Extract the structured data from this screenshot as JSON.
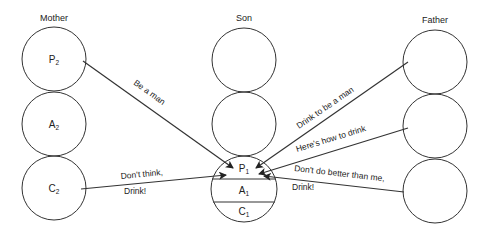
{
  "columns": {
    "mother": {
      "title": "Mother"
    },
    "son": {
      "title": "Son"
    },
    "father": {
      "title": "Father"
    }
  },
  "mother_states": [
    {
      "letter": "P",
      "sub": "2"
    },
    {
      "letter": "A",
      "sub": "2"
    },
    {
      "letter": "C",
      "sub": "2"
    }
  ],
  "son_states": [
    {
      "letter": "P",
      "sub": "1"
    },
    {
      "letter": "A",
      "sub": "1"
    },
    {
      "letter": "C",
      "sub": "1"
    }
  ],
  "transactions": [
    {
      "from": "Mother P2",
      "to": "Son P1",
      "label": "Be a man"
    },
    {
      "from": "Mother C2",
      "to": "Son P1",
      "label_line1": "Don't think,",
      "label_line2": "Drink!"
    },
    {
      "from": "Father 1",
      "to": "Son P1",
      "label": "Drink to be a man"
    },
    {
      "from": "Father 2",
      "to": "Son P1",
      "label": "Here's how to drink"
    },
    {
      "from": "Father 3",
      "to": "Son P1",
      "label_line1": "Don't do better than me,",
      "label_line2": "Drink!"
    }
  ]
}
